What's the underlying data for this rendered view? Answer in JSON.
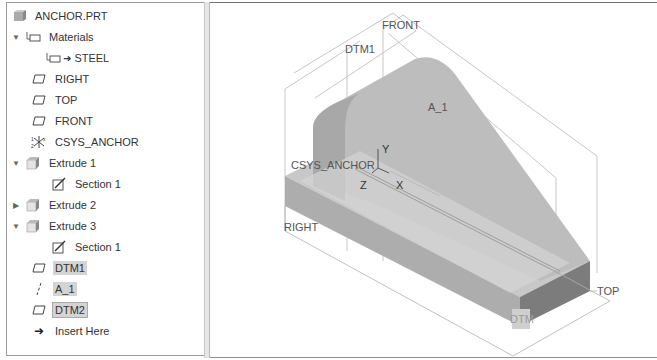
{
  "model_tree": {
    "root": {
      "label": "ANCHOR.PRT",
      "icon": "part-icon"
    },
    "items": [
      {
        "label": "Materials",
        "icon": "materials-icon",
        "expander": "expanded",
        "level": 0
      },
      {
        "label": "STEEL",
        "icon": "material-assigned-icon",
        "level": 1
      },
      {
        "label": "RIGHT",
        "icon": "datum-plane-icon",
        "level": 0
      },
      {
        "label": "TOP",
        "icon": "datum-plane-icon",
        "level": 0
      },
      {
        "label": "FRONT",
        "icon": "datum-plane-icon",
        "level": 0
      },
      {
        "label": "CSYS_ANCHOR",
        "icon": "csys-icon",
        "level": 0
      },
      {
        "label": "Extrude 1",
        "icon": "extrude-icon",
        "expander": "expanded",
        "level": 0
      },
      {
        "label": "Section 1",
        "icon": "sketch-icon",
        "level": 1
      },
      {
        "label": "Extrude 2",
        "icon": "extrude-icon",
        "expander": "collapsed",
        "level": 0
      },
      {
        "label": "Extrude 3",
        "icon": "extrude-icon",
        "expander": "expanded",
        "level": 0
      },
      {
        "label": "Section 1",
        "icon": "sketch-icon",
        "level": 1
      },
      {
        "label": "DTM1",
        "icon": "datum-plane-icon",
        "level": 0,
        "highlighted": true
      },
      {
        "label": "A_1",
        "icon": "datum-axis-icon",
        "level": 0,
        "highlighted": true
      },
      {
        "label": "DTM2",
        "icon": "datum-plane-icon",
        "level": 0,
        "highlighted": true,
        "selected": true
      },
      {
        "label": "Insert Here",
        "icon": "insert-arrow-icon",
        "level": 0
      }
    ]
  },
  "viewport": {
    "labels": {
      "front": "FRONT",
      "dtm1": "DTM1",
      "a1": "A_1",
      "csys": "CSYS_ANCHOR",
      "y": "Y",
      "z": "Z",
      "x": "X",
      "right": "RIGHT",
      "top": "TOP",
      "dtm2": "DTM"
    },
    "colors": {
      "body_top": "#c4c4c4",
      "body_side": "#a9a9a9",
      "body_front": "#7a7a7a",
      "datum_line": "#b0b0b0"
    }
  }
}
